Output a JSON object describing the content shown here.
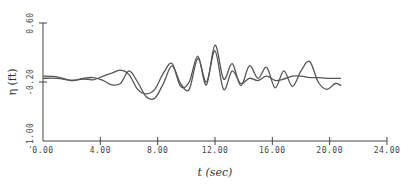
{
  "chart_data": {
    "type": "line",
    "title": "",
    "xlabel": "t (sec)",
    "ylabel": "η (ft)",
    "xlim": [
      0,
      24
    ],
    "ylim": [
      -1.0,
      0.6
    ],
    "grid": false,
    "legend": null,
    "x_ticks": [
      "0.00",
      "4.00",
      "8.00",
      "12.00",
      "16.00",
      "20.00",
      "24.00"
    ],
    "y_ticks": [
      "-1.00",
      "-0.20",
      "0.60"
    ],
    "series": [
      {
        "name": "series-1",
        "x": [
          0.0,
          1.0,
          2.0,
          2.8,
          3.5,
          4.2,
          4.8,
          5.4,
          6.0,
          6.6,
          7.2,
          7.8,
          8.4,
          9.0,
          9.6,
          10.2,
          10.8,
          11.4,
          12.0,
          12.6,
          13.2,
          13.8,
          14.4,
          15.0,
          15.6,
          16.2,
          16.8,
          17.4,
          18.0,
          18.6,
          19.2,
          19.8,
          20.4,
          20.8
        ],
        "y": [
          -0.12,
          -0.13,
          -0.18,
          -0.15,
          -0.14,
          -0.18,
          -0.24,
          -0.22,
          -0.05,
          -0.2,
          -0.4,
          -0.42,
          -0.22,
          0.02,
          -0.22,
          -0.3,
          0.12,
          -0.2,
          0.22,
          -0.3,
          -0.05,
          -0.22,
          -0.15,
          -0.18,
          -0.12,
          -0.18,
          -0.16,
          -0.12,
          -0.12,
          -0.14,
          -0.14,
          -0.15,
          -0.15,
          -0.15
        ]
      },
      {
        "name": "series-2",
        "x": [
          0.0,
          1.0,
          2.0,
          2.8,
          3.5,
          4.2,
          4.8,
          5.4,
          6.0,
          6.6,
          7.2,
          7.8,
          8.4,
          9.0,
          9.6,
          10.2,
          10.8,
          11.4,
          12.0,
          12.6,
          13.2,
          13.8,
          14.4,
          15.0,
          15.6,
          16.2,
          16.8,
          17.4,
          18.0,
          18.6,
          19.2,
          19.8,
          20.4,
          20.8
        ],
        "y": [
          -0.15,
          -0.15,
          -0.18,
          -0.16,
          -0.17,
          -0.12,
          -0.08,
          -0.04,
          -0.1,
          -0.3,
          -0.36,
          -0.3,
          -0.08,
          0.05,
          -0.26,
          -0.2,
          0.15,
          -0.24,
          0.3,
          -0.16,
          0.05,
          -0.25,
          0.02,
          -0.15,
          0.0,
          -0.28,
          -0.05,
          -0.26,
          -0.05,
          0.08,
          -0.2,
          -0.3,
          -0.22,
          -0.25
        ]
      }
    ]
  }
}
